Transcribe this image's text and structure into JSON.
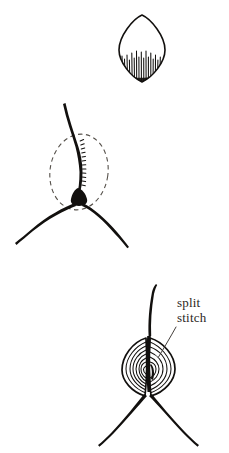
{
  "figure": {
    "background_color": "#ffffff",
    "ink_color": "#12100e",
    "dash_color": "#55504a",
    "width": 229,
    "height": 453
  },
  "panels": [
    {
      "id": "panel-1",
      "name": "hatched-petal-shape",
      "description": "pointed oval leaf shape with vertical hatching in lower half",
      "center_x": 142,
      "center_y": 48
    },
    {
      "id": "panel-2",
      "name": "junction-with-dashed-ellipse",
      "description": "Y junction of threads with dashed ellipse around the split point and dark knot blob",
      "center_x": 78,
      "center_y": 175
    },
    {
      "id": "panel-3",
      "name": "completed-split-stitch",
      "description": "finished split stitch with two concentric stitched lobes and label",
      "center_x": 150,
      "center_y": 370
    }
  ],
  "annotations": [
    {
      "name": "split-stitch-label",
      "line_1": "split",
      "line_2": "stitch",
      "x": 177,
      "y_line_1": 307,
      "y_line_2": 322,
      "leader_from_x": 176,
      "leader_from_y": 327,
      "leader_to_x": 158,
      "leader_to_y": 358
    }
  ]
}
